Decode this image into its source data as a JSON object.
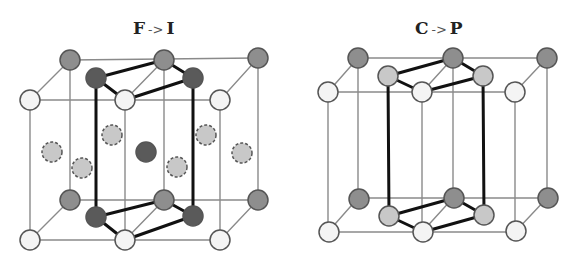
{
  "diagrams": [
    {
      "name": "f-to-i",
      "title": {
        "from": "F",
        "arrow": "->",
        "to": "I",
        "x": 133
      },
      "cube": {
        "back": [
          [
            70,
            60
          ],
          [
            258,
            58
          ],
          [
            258,
            200
          ],
          [
            70,
            200
          ]
        ],
        "front": [
          [
            30,
            100
          ],
          [
            220,
            100
          ],
          [
            220,
            240
          ],
          [
            30,
            240
          ]
        ],
        "mid_back": [
          164,
          60,
          164,
          200
        ],
        "mid_front": [
          125,
          100,
          125,
          240
        ]
      },
      "cell_top": [
        [
          96,
          78
        ],
        [
          164,
          60
        ],
        [
          193,
          78
        ],
        [
          125,
          100
        ]
      ],
      "cell_bottom": [
        [
          96,
          217
        ],
        [
          164,
          200
        ],
        [
          193,
          216
        ],
        [
          125,
          240
        ]
      ],
      "cell_verticals": [
        [
          96,
          78,
          96,
          217
        ],
        [
          193,
          78,
          193,
          216
        ]
      ],
      "atoms": [
        {
          "x": 70,
          "y": 60,
          "c": "gray"
        },
        {
          "x": 164,
          "y": 60,
          "c": "gray"
        },
        {
          "x": 258,
          "y": 58,
          "c": "gray"
        },
        {
          "x": 30,
          "y": 100,
          "c": "white"
        },
        {
          "x": 125,
          "y": 100,
          "c": "white"
        },
        {
          "x": 220,
          "y": 100,
          "c": "white"
        },
        {
          "x": 96,
          "y": 78,
          "c": "dark"
        },
        {
          "x": 193,
          "y": 78,
          "c": "dark"
        },
        {
          "x": 112,
          "y": 135,
          "c": "light",
          "dash": true
        },
        {
          "x": 206,
          "y": 135,
          "c": "light",
          "dash": true
        },
        {
          "x": 52,
          "y": 152,
          "c": "light",
          "dash": true
        },
        {
          "x": 146,
          "y": 152,
          "c": "dark"
        },
        {
          "x": 242,
          "y": 153,
          "c": "light",
          "dash": true
        },
        {
          "x": 82,
          "y": 168,
          "c": "light",
          "dash": true
        },
        {
          "x": 177,
          "y": 167,
          "c": "light",
          "dash": true
        },
        {
          "x": 70,
          "y": 200,
          "c": "gray"
        },
        {
          "x": 164,
          "y": 200,
          "c": "gray"
        },
        {
          "x": 258,
          "y": 200,
          "c": "gray"
        },
        {
          "x": 96,
          "y": 217,
          "c": "dark"
        },
        {
          "x": 193,
          "y": 216,
          "c": "dark"
        },
        {
          "x": 30,
          "y": 240,
          "c": "white"
        },
        {
          "x": 125,
          "y": 240,
          "c": "white"
        },
        {
          "x": 220,
          "y": 240,
          "c": "white"
        }
      ]
    },
    {
      "name": "c-to-p",
      "title": {
        "from": "C",
        "arrow": "->",
        "to": "P",
        "x": 415
      },
      "cube": {
        "back": [
          [
            358,
            58
          ],
          [
            547,
            58
          ],
          [
            547,
            198
          ],
          [
            358,
            198
          ]
        ],
        "front": [
          [
            328,
            92
          ],
          [
            515,
            92
          ],
          [
            515,
            232
          ],
          [
            328,
            232
          ]
        ],
        "mid_back": [
          453,
          58,
          453,
          198
        ],
        "mid_front": [
          422,
          92,
          422,
          232
        ]
      },
      "cell_top": [
        [
          388,
          76
        ],
        [
          453,
          58
        ],
        [
          483,
          76
        ],
        [
          422,
          92
        ]
      ],
      "cell_bottom": [
        [
          389,
          216
        ],
        [
          454,
          198
        ],
        [
          484,
          215
        ],
        [
          423,
          232
        ]
      ],
      "cell_verticals": [
        [
          388,
          76,
          389,
          216
        ],
        [
          483,
          76,
          484,
          215
        ]
      ],
      "atoms": [
        {
          "x": 358,
          "y": 58,
          "c": "gray"
        },
        {
          "x": 453,
          "y": 58,
          "c": "gray"
        },
        {
          "x": 547,
          "y": 58,
          "c": "gray"
        },
        {
          "x": 388,
          "y": 76,
          "c": "light"
        },
        {
          "x": 483,
          "y": 76,
          "c": "light"
        },
        {
          "x": 328,
          "y": 92,
          "c": "white"
        },
        {
          "x": 422,
          "y": 92,
          "c": "white"
        },
        {
          "x": 515,
          "y": 92,
          "c": "white"
        },
        {
          "x": 359,
          "y": 199,
          "c": "gray"
        },
        {
          "x": 454,
          "y": 198,
          "c": "gray"
        },
        {
          "x": 548,
          "y": 198,
          "c": "gray"
        },
        {
          "x": 389,
          "y": 216,
          "c": "light"
        },
        {
          "x": 484,
          "y": 215,
          "c": "light"
        },
        {
          "x": 329,
          "y": 232,
          "c": "white"
        },
        {
          "x": 423,
          "y": 232,
          "c": "white"
        },
        {
          "x": 516,
          "y": 231,
          "c": "white"
        }
      ]
    }
  ],
  "colors": {
    "white": "#f4f4f4",
    "light": "#c8c8c8",
    "gray": "#8e8e8e",
    "dark": "#5a5a5a",
    "stroke": "#555555",
    "edge": "#8a8a8a",
    "bold": "#111111"
  }
}
